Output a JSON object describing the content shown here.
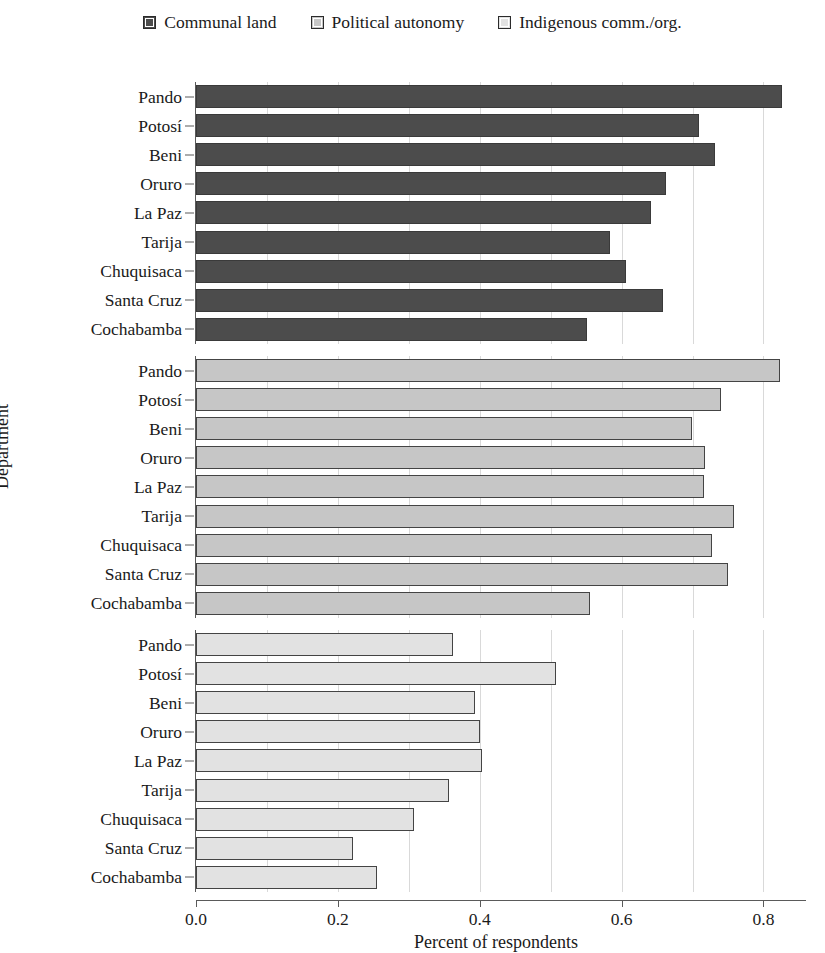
{
  "legend": {
    "items": [
      {
        "label": "Communal land",
        "color": "#4c4c4c"
      },
      {
        "label": "Political autonomy",
        "color": "#c6c6c6"
      },
      {
        "label": "Indigenous comm./org.",
        "color": "#e2e2e2"
      }
    ]
  },
  "axes": {
    "ylabel": "Department",
    "xlabel": "Percent of respondents",
    "xticks": [
      "0.0",
      "0.2",
      "0.4",
      "0.6",
      "0.8"
    ]
  },
  "chart_data": {
    "type": "bar",
    "orientation": "horizontal",
    "title": "",
    "xlabel": "Percent of respondents",
    "ylabel": "Department",
    "xlim": [
      0,
      0.86
    ],
    "xticks": [
      0.0,
      0.2,
      0.4,
      0.6,
      0.8
    ],
    "grid": "vertical minor gridlines every 0.1",
    "legend_position": "top-center",
    "categories": [
      "Pando",
      "Potosí",
      "Beni",
      "Oruro",
      "La Paz",
      "Tarija",
      "Chuquisaca",
      "Santa Cruz",
      "Cochabamba"
    ],
    "series": [
      {
        "name": "Communal land",
        "color": "#4c4c4c",
        "values": [
          0.826,
          0.709,
          0.732,
          0.662,
          0.641,
          0.583,
          0.606,
          0.659,
          0.551
        ]
      },
      {
        "name": "Political autonomy",
        "color": "#c6c6c6",
        "values": [
          0.823,
          0.74,
          0.699,
          0.718,
          0.716,
          0.758,
          0.727,
          0.75,
          0.555
        ]
      },
      {
        "name": "Indigenous comm./org.",
        "color": "#e2e2e2",
        "values": [
          0.363,
          0.507,
          0.393,
          0.401,
          0.403,
          0.357,
          0.307,
          0.221,
          0.255
        ]
      }
    ]
  }
}
